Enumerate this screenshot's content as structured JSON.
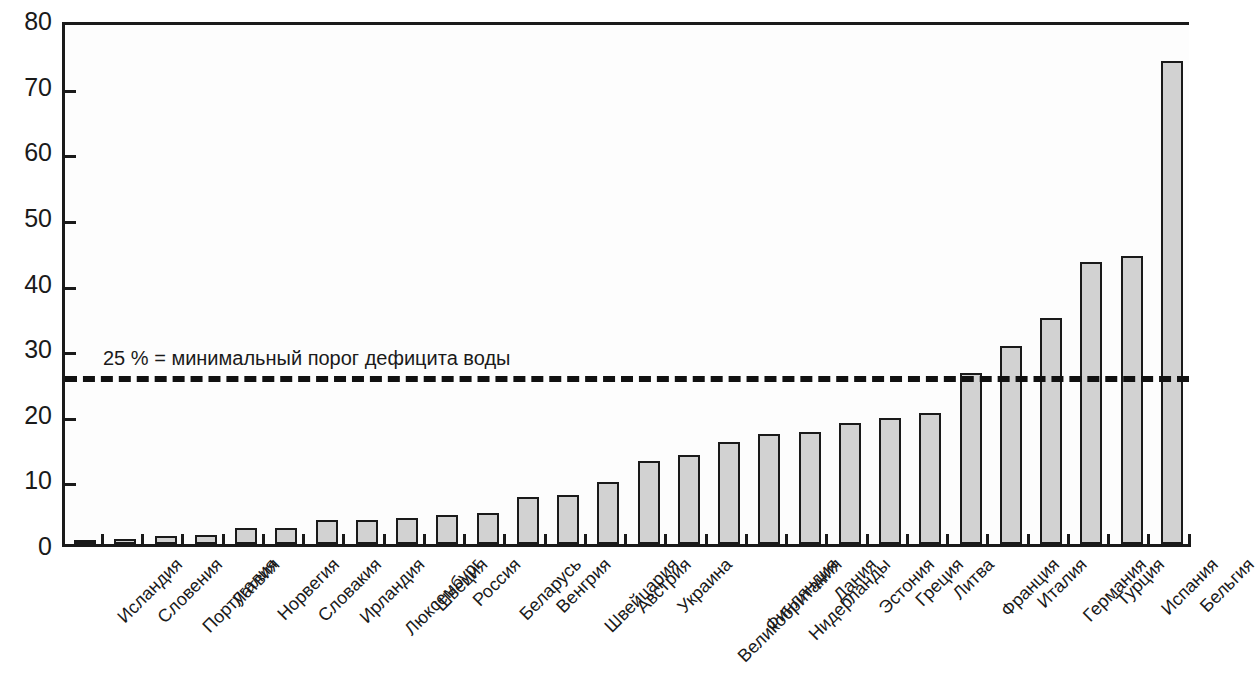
{
  "chart": {
    "type": "bar",
    "background_color": "#ffffff",
    "plot_background_color": "#fdfdfd",
    "bar_fill_color": "#d2d2d2",
    "bar_border_color": "#1a1a1a",
    "axis_color": "#1a1a1a",
    "threshold_color": "#111111"
  },
  "chart_data": {
    "type": "bar",
    "title": "",
    "xlabel": "",
    "ylabel": "",
    "ylim": [
      0,
      80
    ],
    "ytick_labels": [
      "0",
      "10",
      "20",
      "30",
      "40",
      "50",
      "60",
      "70",
      "80"
    ],
    "yticks": [
      0,
      10,
      20,
      30,
      40,
      50,
      60,
      70,
      80
    ],
    "grid": false,
    "legend": null,
    "orientation": "vertical",
    "categories": [
      "Исландия",
      "Словения",
      "Португалия",
      "Латвия",
      "Норвегия",
      "Словакия",
      "Ирландия",
      "Люксембург",
      "Швеция",
      "Россия",
      "Беларусь",
      "Венгрия",
      "Швейцария",
      "Австрия",
      "Украина",
      "Великобритания",
      "Финляндия",
      "Нидерланды",
      "Дания",
      "Эстония",
      "Греция",
      "Литва",
      "Франция",
      "Италия",
      "Германия",
      "Турция",
      "Испания",
      "Бельгия"
    ],
    "values": [
      0.3,
      0.7,
      1.2,
      1.3,
      2.4,
      2.4,
      3.6,
      3.6,
      3.9,
      4.4,
      4.8,
      7.2,
      7.5,
      9.4,
      12.7,
      13.6,
      15.5,
      16.8,
      17.0,
      18.4,
      19.2,
      19.9,
      26.0,
      30.2,
      34.5,
      43.0,
      43.9,
      73.6
    ],
    "annotations": [
      {
        "name": "water-scarcity-threshold",
        "text": "25 % = минимальный порог дефицита воды",
        "value": 26.0,
        "style": "dashed-horizontal-line"
      }
    ]
  }
}
